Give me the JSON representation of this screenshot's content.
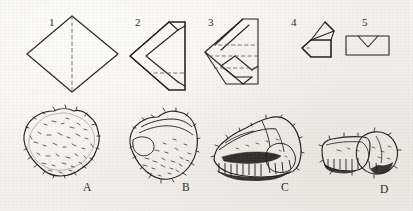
{
  "figure": {
    "background_color": "#f3f1ec",
    "ink_color": "#231f1e",
    "fold_diagrams": [
      {
        "id": "diagram-1",
        "label": "1",
        "label_x": 49,
        "label_y": 17,
        "shape": "diamond-with-vertical-dashed-fold-line",
        "description": "Square rotated 45 degrees (diamond) with a dashed vertical fold line from top vertex to bottom vertex"
      },
      {
        "id": "diagram-2",
        "label": "2",
        "label_x": 135,
        "label_y": 17,
        "shape": "left-pointing-triangle-with-inner-chevron",
        "description": "Diamond folded once into a left-pointing triangle showing an inner chevron flap and a dashed horizontal fold line near the base"
      },
      {
        "id": "diagram-3",
        "label": "3",
        "label_x": 208,
        "label_y": 17,
        "shape": "left-pointing-triangle-with-three-dashed-lines",
        "description": "Folded triangle with diagonal fold creases and three horizontal dashed fold lines"
      },
      {
        "id": "diagram-4",
        "label": "4",
        "label_x": 291,
        "label_y": 17,
        "shape": "rectangle-with-pointed-left-end-and-top-flap",
        "description": "Flattened band with a pointed left end and a folded triangular flap standing on top"
      },
      {
        "id": "diagram-5",
        "label": "5",
        "label_x": 362,
        "label_y": 17,
        "shape": "rectangle-with-v-notch-flap",
        "description": "Closed rectangle with a V shaped tucked flap on the upper edge"
      }
    ],
    "artifacts": [
      {
        "id": "artifact-a",
        "label": "A",
        "label_x": 83,
        "label_y": 182,
        "description": "Rounded squarish cortical nodule with dense stippled cortex texture"
      },
      {
        "id": "artifact-b",
        "label": "B",
        "label_x": 182,
        "label_y": 182,
        "description": "Wedge shaped partly flaked nodule with cortex remaining on the lower edge"
      },
      {
        "id": "artifact-c",
        "label": "C",
        "label_x": 281,
        "label_y": 182,
        "description": "Flaked core with faceted upper surface and a row of removal scars along the base"
      },
      {
        "id": "artifact-d",
        "label": "D",
        "label_x": 380,
        "label_y": 184,
        "description": "Elongated blank with a rounded bulbous end at the right"
      }
    ]
  }
}
